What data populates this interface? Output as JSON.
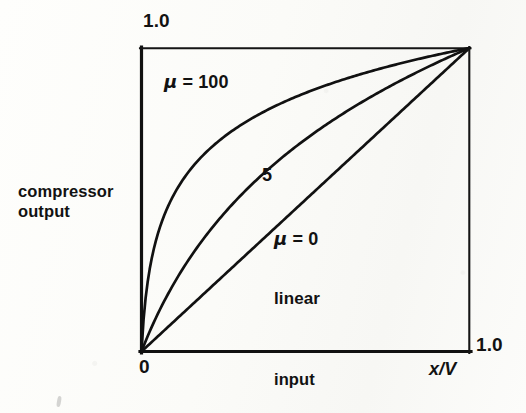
{
  "figure": {
    "type": "line-plot",
    "axes": {
      "y_max_label": "1.0",
      "x_max_label": "1.0",
      "origin_label": "0",
      "ylabel": "compressor\noutput",
      "xlabel": "input",
      "x_variable_label": "x/V"
    },
    "annotations": {
      "mu100": {
        "mu_symbol": "μ",
        "text": " = 100"
      },
      "mu5": {
        "text": "5"
      },
      "mu0": {
        "mu_symbol": "μ",
        "text": " = 0"
      },
      "linear": {
        "text": "linear"
      }
    },
    "colors": {
      "ink": "#121212",
      "paper": "#fdfdfb"
    }
  },
  "chart_data": {
    "type": "line",
    "title": "",
    "xlabel": "input  x/V",
    "ylabel": "compressor output",
    "xlim": [
      0,
      1
    ],
    "ylim": [
      0,
      1
    ],
    "grid": false,
    "legend": "inline-annotations",
    "x": [
      0,
      0.05,
      0.1,
      0.15,
      0.2,
      0.25,
      0.3,
      0.35,
      0.4,
      0.45,
      0.5,
      0.55,
      0.6,
      0.65,
      0.7,
      0.75,
      0.8,
      0.85,
      0.9,
      0.95,
      1.0
    ],
    "series": [
      {
        "name": "μ = 100",
        "mu": 100,
        "label": "μ = 100",
        "values": [
          0,
          0.383,
          0.519,
          0.603,
          0.664,
          0.712,
          0.751,
          0.785,
          0.814,
          0.84,
          0.863,
          0.884,
          0.903,
          0.921,
          0.937,
          0.953,
          0.967,
          0.981,
          0.994,
          1.006,
          1.0
        ]
      },
      {
        "name": "5",
        "mu": 5,
        "label": "5",
        "values": [
          0,
          0.122,
          0.231,
          0.328,
          0.415,
          0.494,
          0.566,
          0.632,
          0.693,
          0.749,
          0.802,
          0.851,
          0.896,
          0.939,
          0.98,
          1.018,
          1.054,
          1.088,
          1.12,
          1.151,
          1.0
        ]
      },
      {
        "name": "μ = 0 (linear)",
        "mu": 0,
        "label": "μ = 0",
        "values": [
          0,
          0.05,
          0.1,
          0.15,
          0.2,
          0.25,
          0.3,
          0.35,
          0.4,
          0.45,
          0.5,
          0.55,
          0.6,
          0.65,
          0.7,
          0.75,
          0.8,
          0.85,
          0.9,
          0.95,
          1.0
        ]
      }
    ],
    "annotations": [
      {
        "text": "μ = 100",
        "x": 0.08,
        "y": 0.88
      },
      {
        "text": "5",
        "x": 0.38,
        "y": 0.58
      },
      {
        "text": "μ = 0",
        "x": 0.42,
        "y": 0.38
      },
      {
        "text": "linear",
        "x": 0.42,
        "y": 0.18
      }
    ]
  }
}
